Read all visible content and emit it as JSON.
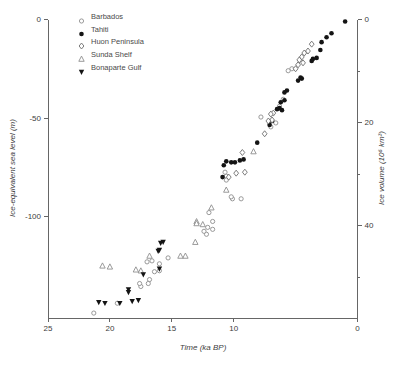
{
  "chart_data": {
    "type": "scatter",
    "title": "",
    "xlabel": "Time (ka BP)",
    "ylabel_left": "Ice-equivalent sea level (m)",
    "ylabel_right": "Ice volume (10⁶ km³)",
    "x_axis": {
      "min": 0,
      "max": 25,
      "reversed": true,
      "ticks": [
        25,
        20,
        15,
        10,
        0
      ],
      "grid": false
    },
    "y_axis_left": {
      "min": -151.5,
      "max": 0,
      "ticks": [
        0,
        -50,
        -100
      ],
      "grid": false
    },
    "y_axis_right": {
      "min": 0,
      "max": 58,
      "ticks": [
        0,
        20,
        40
      ],
      "minor_ticks": [
        10,
        30,
        50
      ]
    },
    "legend_position": "top-left-inside",
    "series": [
      {
        "name": "Barbados",
        "marker": "open-circle",
        "color": "#8f8f8f",
        "points": [
          [
            5.3,
            -25
          ],
          [
            5.6,
            -26
          ],
          [
            6.0,
            -40.5
          ],
          [
            6.3,
            -44
          ],
          [
            6.6,
            -52.5
          ],
          [
            7.0,
            -54.5
          ],
          [
            7.8,
            -49.5
          ],
          [
            9.4,
            -91
          ],
          [
            10.1,
            -91
          ],
          [
            10.2,
            -90
          ],
          [
            10.6,
            -79.5
          ],
          [
            10.6,
            -81.5
          ],
          [
            10.7,
            -77.5
          ],
          [
            11.7,
            -102.5
          ],
          [
            11.7,
            -106.5
          ],
          [
            12.0,
            -98
          ],
          [
            12.1,
            -105.5
          ],
          [
            12.2,
            -109
          ],
          [
            12.4,
            -107.5
          ],
          [
            15.3,
            -121
          ],
          [
            16.0,
            -124
          ],
          [
            16.0,
            -127.5
          ],
          [
            16.4,
            -128
          ],
          [
            16.6,
            -122.5
          ],
          [
            16.8,
            -132
          ],
          [
            17.0,
            -123
          ],
          [
            16.9,
            -134
          ],
          [
            17.5,
            -135.5
          ],
          [
            17.6,
            -134
          ],
          [
            19.4,
            -144
          ],
          [
            21.3,
            -149
          ]
        ]
      },
      {
        "name": "Tahiti",
        "marker": "filled-circle",
        "color": "#141414",
        "points": [
          [
            1.0,
            -1
          ],
          [
            2.1,
            -7
          ],
          [
            2.5,
            -9
          ],
          [
            2.9,
            -11.5
          ],
          [
            3.0,
            -15.5
          ],
          [
            3.3,
            -19.5
          ],
          [
            3.6,
            -20
          ],
          [
            3.7,
            -21
          ],
          [
            4.5,
            -30
          ],
          [
            4.6,
            -29.5
          ],
          [
            4.8,
            -31
          ],
          [
            5.7,
            -36
          ],
          [
            5.9,
            -37
          ],
          [
            5.9,
            -41
          ],
          [
            6.2,
            -42
          ],
          [
            6.1,
            -46
          ],
          [
            6.3,
            -45
          ],
          [
            6.5,
            -45.5
          ],
          [
            6.9,
            -51.5
          ],
          [
            7.1,
            -53.5
          ],
          [
            8.1,
            -62.5
          ],
          [
            9.2,
            -71
          ],
          [
            9.5,
            -71.5
          ],
          [
            9.9,
            -72.5
          ],
          [
            10.2,
            -72.5
          ],
          [
            10.6,
            -72
          ],
          [
            10.8,
            -74
          ],
          [
            10.9,
            -80
          ]
        ]
      },
      {
        "name": "Huon Peninsula",
        "marker": "open-diamond",
        "color": "#6e6e6e",
        "points": [
          [
            3.7,
            -12.5
          ],
          [
            4.0,
            -16
          ],
          [
            4.3,
            -17
          ],
          [
            4.4,
            -22
          ],
          [
            4.5,
            -19
          ],
          [
            4.7,
            -20.5
          ],
          [
            4.8,
            -23
          ],
          [
            5.0,
            -25
          ],
          [
            6.8,
            -47.5
          ],
          [
            6.9,
            -51
          ],
          [
            7.0,
            -48
          ],
          [
            7.2,
            -51.5
          ],
          [
            7.5,
            -58
          ],
          [
            9.1,
            -77.5
          ],
          [
            9.3,
            -67.5
          ],
          [
            9.8,
            -78
          ],
          [
            10.4,
            -80
          ]
        ]
      },
      {
        "name": "Sunda Shelf",
        "marker": "open-triangle",
        "color": "#8f8f8f",
        "points": [
          [
            8.4,
            -67
          ],
          [
            10.6,
            -86.5
          ],
          [
            11.8,
            -95.5
          ],
          [
            12.5,
            -104
          ],
          [
            13.0,
            -102.5
          ],
          [
            13.0,
            -103.5
          ],
          [
            13.1,
            -113
          ],
          [
            13.9,
            -120
          ],
          [
            14.3,
            -120
          ],
          [
            16.8,
            -120
          ],
          [
            17.5,
            -127.5
          ],
          [
            17.9,
            -127
          ],
          [
            20.0,
            -125.5
          ],
          [
            20.6,
            -125
          ]
        ]
      },
      {
        "name": "Bonaparte Gulf",
        "marker": "filled-triangle-down",
        "color": "#141414",
        "points": [
          [
            15.7,
            -113
          ],
          [
            15.9,
            -113.5
          ],
          [
            16.0,
            -117
          ],
          [
            16.1,
            -117.5
          ],
          [
            16.0,
            -126.5
          ],
          [
            17.3,
            -129.5
          ],
          [
            17.7,
            -142.5
          ],
          [
            18.2,
            -143
          ],
          [
            18.5,
            -137
          ],
          [
            18.5,
            -138.5
          ],
          [
            19.2,
            -144
          ],
          [
            20.4,
            -144
          ],
          [
            20.9,
            -143.5
          ]
        ]
      }
    ]
  },
  "style": {
    "axis_color": "#666666",
    "tick_label_color": "#3d3d3d",
    "tick_label_size": 8
  }
}
